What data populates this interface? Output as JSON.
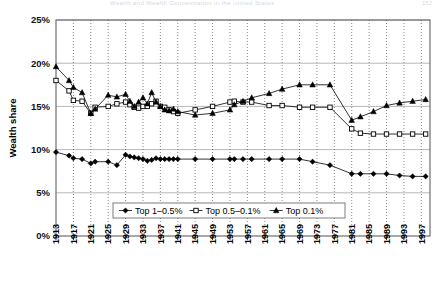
{
  "header": {
    "title": "Wealth and Wealth Concentration in the United States",
    "page": "152"
  },
  "axes": {
    "ylabel": "Wealth share",
    "yticks": [
      "0%",
      "5%",
      "10%",
      "15%",
      "20%",
      "25%"
    ],
    "xticks": [
      "1913",
      "1917",
      "1921",
      "1925",
      "1929",
      "1933",
      "1937",
      "1941",
      "1945",
      "1949",
      "1953",
      "1957",
      "1961",
      "1965",
      "1969",
      "1973",
      "1977",
      "1981",
      "1985",
      "1989",
      "1993",
      "1997"
    ]
  },
  "legend": {
    "items": [
      {
        "label": "Top 1–0.5%",
        "marker": "filled-diamond"
      },
      {
        "label": "Top 0.5–0.1%",
        "marker": "open-square"
      },
      {
        "label": "Top 0.1%",
        "marker": "filled-triangle"
      }
    ]
  },
  "chart_data": {
    "type": "line",
    "title": "Wealth and Wealth Concentration in the United States",
    "xlabel": "",
    "ylabel": "Wealth share",
    "ylim": [
      0,
      25
    ],
    "xlim": [
      1913,
      1999
    ],
    "grid": true,
    "legend_position": "bottom-center",
    "x": [
      1913,
      1916,
      1917,
      1919,
      1921,
      1922,
      1925,
      1927,
      1929,
      1930,
      1931,
      1932,
      1933,
      1934,
      1935,
      1936,
      1937,
      1938,
      1939,
      1940,
      1941,
      1945,
      1949,
      1953,
      1954,
      1956,
      1958,
      1962,
      1965,
      1969,
      1972,
      1976,
      1981,
      1983,
      1986,
      1989,
      1992,
      1995,
      1998
    ],
    "series": [
      {
        "name": "Top 1–0.5%",
        "marker": "filled-diamond",
        "values": [
          9.7,
          9.3,
          9.0,
          8.9,
          8.4,
          8.6,
          8.6,
          8.2,
          9.4,
          9.2,
          9.1,
          9.0,
          8.9,
          8.7,
          8.8,
          9.0,
          8.9,
          8.9,
          8.9,
          8.9,
          8.9,
          8.9,
          8.9,
          8.9,
          8.9,
          8.9,
          8.9,
          8.9,
          8.9,
          8.9,
          8.6,
          8.2,
          7.2,
          7.2,
          7.2,
          7.2,
          7.0,
          6.9,
          6.9
        ]
      },
      {
        "name": "Top 0.5–0.1%",
        "marker": "open-square",
        "values": [
          18.0,
          16.8,
          15.7,
          15.6,
          14.2,
          14.9,
          15.0,
          15.3,
          15.5,
          15.2,
          14.9,
          14.8,
          15.0,
          15.0,
          15.3,
          15.6,
          15.0,
          14.9,
          14.6,
          14.4,
          14.2,
          14.6,
          15.0,
          15.5,
          15.6,
          15.5,
          15.5,
          15.1,
          15.1,
          14.9,
          14.9,
          14.9,
          12.4,
          11.9,
          11.8,
          11.8,
          11.8,
          11.8,
          11.8
        ]
      },
      {
        "name": "Top 0.1%",
        "marker": "filled-triangle",
        "values": [
          19.6,
          18.0,
          17.2,
          16.6,
          14.2,
          14.7,
          16.3,
          16.1,
          16.4,
          15.6,
          15.0,
          15.5,
          16.0,
          15.3,
          16.6,
          15.5,
          15.0,
          14.6,
          14.5,
          14.7,
          14.4,
          14.0,
          14.2,
          14.6,
          15.2,
          15.6,
          16.0,
          16.5,
          17.0,
          17.5,
          17.5,
          17.5,
          13.4,
          13.8,
          14.4,
          15.1,
          15.4,
          15.6,
          15.8
        ]
      }
    ]
  }
}
